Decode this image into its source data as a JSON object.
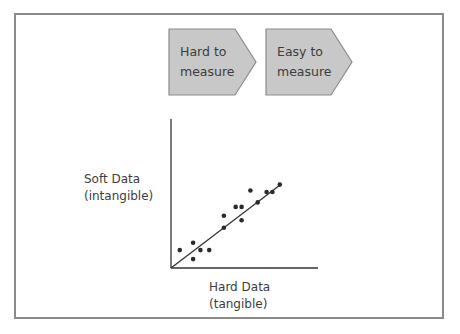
{
  "flow": {
    "steps": [
      {
        "line1": "Hard to",
        "line2": "measure"
      },
      {
        "line1": "Easy to",
        "line2": "measure"
      }
    ],
    "fill_color": "#c8c8c8",
    "stroke_color": "#8c8c8c"
  },
  "axes": {
    "y_label_line1": "Soft Data",
    "y_label_line2": "(intangible)",
    "x_label_line1": "Hard Data",
    "x_label_line2": "(tangible)"
  },
  "chart_data": {
    "type": "scatter",
    "title": "",
    "xlabel": "Hard Data (tangible)",
    "ylabel": "Soft Data (intangible)",
    "grid": false,
    "legend": null,
    "xlim": [
      0,
      100
    ],
    "ylim": [
      0,
      100
    ],
    "points": [
      {
        "x": 6,
        "y": 12
      },
      {
        "x": 15,
        "y": 17
      },
      {
        "x": 15,
        "y": 6
      },
      {
        "x": 20,
        "y": 12
      },
      {
        "x": 26,
        "y": 12
      },
      {
        "x": 36,
        "y": 27
      },
      {
        "x": 36,
        "y": 35
      },
      {
        "x": 44,
        "y": 41
      },
      {
        "x": 48,
        "y": 41
      },
      {
        "x": 48,
        "y": 32
      },
      {
        "x": 54,
        "y": 52
      },
      {
        "x": 59,
        "y": 44
      },
      {
        "x": 65,
        "y": 51
      },
      {
        "x": 69,
        "y": 51
      },
      {
        "x": 74,
        "y": 56
      }
    ],
    "trend_line": {
      "x0": 0,
      "y0": 0,
      "x1": 74,
      "y1": 57
    },
    "annotations": [
      "Hard to measure",
      "Easy to measure"
    ]
  }
}
